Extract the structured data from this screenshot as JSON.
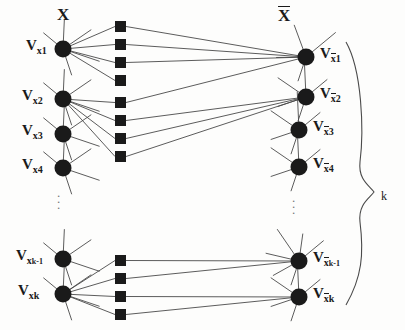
{
  "figure": {
    "type": "bipartite-graph-diagram",
    "width": 405,
    "height": 330,
    "background_color": "#fdfdfc",
    "ink_color": "#1a1a1a"
  },
  "labels": {
    "left_set": "X",
    "right_set": "X",
    "right_set_overline": true,
    "brace_label": "k"
  },
  "left_nodes": [
    {
      "id": "vx1",
      "base": "V",
      "sub": "x",
      "sub2": "1",
      "x": 63,
      "y": 49,
      "label_x": 26,
      "label_y": 38
    },
    {
      "id": "vx2",
      "base": "V",
      "sub": "x",
      "sub2": "2",
      "x": 63,
      "y": 99,
      "label_x": 22,
      "label_y": 88
    },
    {
      "id": "vx3",
      "base": "V",
      "sub": "x",
      "sub2": "3",
      "x": 63,
      "y": 134,
      "label_x": 22,
      "label_y": 123
    },
    {
      "id": "vx4",
      "base": "V",
      "sub": "x",
      "sub2": "4",
      "x": 63,
      "y": 168,
      "label_x": 22,
      "label_y": 157
    },
    {
      "id": "vxk-1",
      "base": "V",
      "sub": "x",
      "sub2": "k-1",
      "x": 63,
      "y": 259,
      "label_x": 16,
      "label_y": 248
    },
    {
      "id": "vxk",
      "base": "V",
      "sub": "x",
      "sub2": "k",
      "x": 63,
      "y": 294,
      "label_x": 18,
      "label_y": 283
    }
  ],
  "right_nodes": [
    {
      "id": "vbx1",
      "base": "V",
      "sub": "x",
      "sub2": "1",
      "overline": true,
      "x": 306,
      "y": 57,
      "label_x": 320,
      "label_y": 46
    },
    {
      "id": "vbx2",
      "base": "V",
      "sub": "x",
      "sub2": "2",
      "overline": true,
      "x": 306,
      "y": 97,
      "label_x": 320,
      "label_y": 86
    },
    {
      "id": "vbx3",
      "base": "V",
      "sub": "x",
      "sub2": "3",
      "overline": true,
      "x": 299,
      "y": 130,
      "label_x": 313,
      "label_y": 119
    },
    {
      "id": "vbx4",
      "base": "V",
      "sub": "x",
      "sub2": "4",
      "overline": true,
      "x": 299,
      "y": 167,
      "label_x": 313,
      "label_y": 156
    },
    {
      "id": "vbxk-1",
      "base": "V",
      "sub": "x",
      "sub2": "k-1",
      "overline": true,
      "x": 299,
      "y": 261,
      "label_x": 313,
      "label_y": 250
    },
    {
      "id": "vbxk",
      "base": "V",
      "sub": "x",
      "sub2": "k",
      "overline": true,
      "x": 299,
      "y": 297,
      "label_x": 313,
      "label_y": 286
    }
  ],
  "squares": {
    "x": 115,
    "size": 11,
    "top_group_y": [
      21,
      39,
      57,
      75,
      97,
      115,
      133,
      151
    ],
    "bottom_group_y": [
      255,
      273,
      291,
      309
    ]
  },
  "ellipsis": [
    {
      "name": "left-vertical-ellipsis",
      "x": 57,
      "y": 190
    },
    {
      "name": "right-vertical-ellipsis",
      "x": 292,
      "y": 195
    }
  ],
  "edges_left_to_squares": [
    {
      "from": "vx1",
      "to_y": 21
    },
    {
      "from": "vx1",
      "to_y": 39
    },
    {
      "from": "vx1",
      "to_y": 57
    },
    {
      "from": "vx1",
      "to_y": 75
    },
    {
      "from": "vx2",
      "to_y": 97
    },
    {
      "from": "vx2",
      "to_y": 115
    },
    {
      "from": "vx2",
      "to_y": 133
    },
    {
      "from": "vx2",
      "to_y": 151
    },
    {
      "from": "vxk",
      "to_y": 255
    },
    {
      "from": "vxk",
      "to_y": 273
    },
    {
      "from": "vxk",
      "to_y": 291
    },
    {
      "from": "vxk",
      "to_y": 309
    }
  ],
  "edges_squares_to_right": [
    {
      "from_y": 21,
      "to": "vbx1"
    },
    {
      "from_y": 39,
      "to": "vbx1"
    },
    {
      "from_y": 57,
      "to": "vbx1"
    },
    {
      "from_y": 97,
      "to": "vbx1"
    },
    {
      "from_y": 115,
      "to": "vbx2"
    },
    {
      "from_y": 133,
      "to": "vbx2"
    },
    {
      "from_y": 151,
      "to": "vbx2"
    },
    {
      "from_y": 255,
      "to": "vbxk-1"
    },
    {
      "from_y": 273,
      "to": "vbxk-1"
    },
    {
      "from_y": 291,
      "to": "vbxk"
    },
    {
      "from_y": 309,
      "to": "vbxk"
    }
  ],
  "stub_edges": {
    "description": "short unconnected line stubs radiating from each node",
    "left_counts": [
      5,
      5,
      5,
      5,
      5,
      5
    ],
    "right_counts": [
      4,
      5,
      5,
      5,
      6,
      5
    ]
  }
}
